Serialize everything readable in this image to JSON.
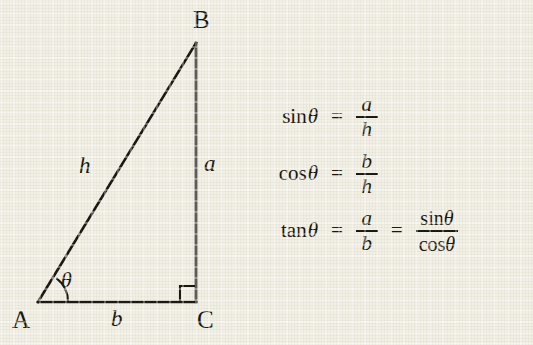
{
  "figure": {
    "background_color": "#f2f0e5",
    "ink_color": "#16150f",
    "triangle": {
      "vertices": [
        {
          "name": "A",
          "label": "A",
          "x": 38,
          "y": 302,
          "role": "angle-theta-vertex"
        },
        {
          "name": "B",
          "label": "B",
          "x": 196,
          "y": 43,
          "role": "apex"
        },
        {
          "name": "C",
          "label": "C",
          "x": 196,
          "y": 302,
          "role": "right-angle-vertex"
        }
      ],
      "sides": [
        {
          "name": "hypotenuse",
          "label": "h",
          "from": "A",
          "to": "B"
        },
        {
          "name": "opposite",
          "label": "a",
          "from": "B",
          "to": "C"
        },
        {
          "name": "adjacent",
          "label": "b",
          "from": "A",
          "to": "C"
        }
      ],
      "angle": {
        "label": "θ",
        "at_vertex": "A",
        "arc_radius": 30
      },
      "right_angle_marker": {
        "at_vertex": "C",
        "size": 16
      }
    },
    "equations": [
      {
        "id": "sine",
        "lhs": "sin",
        "theta": "θ",
        "rel": "=",
        "fraction": {
          "numerator": "a",
          "denominator": "h"
        }
      },
      {
        "id": "cosine",
        "lhs": "cos",
        "theta": "θ",
        "rel": "=",
        "fraction": {
          "numerator": "b",
          "denominator": "h"
        }
      },
      {
        "id": "tangent",
        "lhs": "tan",
        "theta": "θ",
        "rel": "=",
        "fraction": {
          "numerator": "a",
          "denominator": "b"
        },
        "rel2": "=",
        "fraction2": {
          "numerator_fn": "sin",
          "numerator_theta": "θ",
          "denominator_fn": "cos",
          "denominator_theta": "θ"
        }
      }
    ]
  }
}
